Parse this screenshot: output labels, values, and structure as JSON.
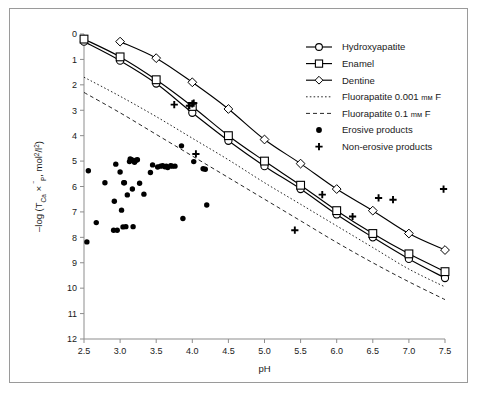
{
  "figure": {
    "border_color": "#9a9a9a",
    "background": "#ffffff",
    "line_color": "#000000"
  },
  "chart_data": {
    "type": "line",
    "title": "",
    "xlabel": "pH",
    "ylabel": "-log (T_Ca x T_P, mol2/l2)",
    "ylabel_parts": {
      "prefix": "–log (T",
      "sub1": "Ca",
      "mid": " × ",
      "overbar": "‾",
      "sub2": "P",
      "tail": ", mol",
      "sup1": "2",
      "slash": "/l",
      "sup2": "2",
      "close": ")"
    },
    "xlim": [
      2.5,
      7.5
    ],
    "ylim": [
      0,
      12
    ],
    "y_inverted": true,
    "grid": false,
    "xticks": [
      "2.5",
      "3.0",
      "3.5",
      "4.0",
      "4.5",
      "5.0",
      "5.5",
      "6.0",
      "6.5",
      "7.0",
      "7.5"
    ],
    "xtick_values": [
      2.5,
      3.0,
      3.5,
      4.0,
      4.5,
      5.0,
      5.5,
      6.0,
      6.5,
      7.0,
      7.5
    ],
    "yticks": [
      "0",
      "1",
      "2",
      "3",
      "4",
      "5",
      "6",
      "7",
      "8",
      "9",
      "10",
      "11",
      "12"
    ],
    "ytick_values": [
      0,
      1,
      2,
      3,
      4,
      5,
      6,
      7,
      8,
      9,
      10,
      11,
      12
    ],
    "legend_position": "top-right",
    "series": [
      {
        "name": "Hydroxyapatite",
        "marker": "circle",
        "linestyle": "solid",
        "x": [
          2.5,
          3.0,
          3.5,
          4.0,
          4.5,
          5.0,
          5.5,
          6.0,
          6.5,
          7.0,
          7.5
        ],
        "values": [
          0.3,
          1.05,
          1.95,
          3.1,
          4.2,
          5.2,
          6.1,
          7.1,
          8.0,
          8.85,
          9.6
        ]
      },
      {
        "name": "Enamel",
        "marker": "square",
        "linestyle": "solid",
        "x": [
          2.5,
          3.0,
          3.5,
          4.0,
          4.5,
          5.0,
          5.5,
          6.0,
          6.5,
          7.0,
          7.5
        ],
        "values": [
          0.2,
          0.9,
          1.8,
          2.85,
          4.0,
          5.0,
          5.95,
          6.95,
          7.85,
          8.65,
          9.35
        ]
      },
      {
        "name": "Dentine",
        "marker": "diamond",
        "linestyle": "solid",
        "x": [
          3.0,
          3.5,
          4.0,
          4.5,
          5.0,
          5.5,
          6.0,
          6.5,
          7.0,
          7.5
        ],
        "values": [
          0.3,
          0.95,
          1.9,
          2.95,
          4.15,
          5.1,
          6.1,
          6.95,
          7.85,
          8.5
        ]
      },
      {
        "name": "Fluorapatite 0.001 mM F",
        "label_prefix": "Fluorapatite 0.001 ",
        "label_unit": "mм",
        "label_suffix": " F",
        "marker": "none",
        "linestyle": "dotted",
        "x": [
          2.5,
          3.0,
          3.5,
          4.0,
          4.5,
          5.0,
          5.5,
          6.0,
          6.5,
          7.0,
          7.5
        ],
        "values": [
          1.7,
          2.45,
          3.25,
          4.1,
          4.95,
          5.85,
          6.7,
          7.55,
          8.4,
          9.25,
          9.95
        ]
      },
      {
        "name": "Fluorapatite 0.1 mM F",
        "label_prefix": "Fluorapatite 0.1 ",
        "label_unit": "mм",
        "label_suffix": " F",
        "marker": "none",
        "linestyle": "dashed",
        "x": [
          2.5,
          3.0,
          3.5,
          4.0,
          4.5,
          5.0,
          5.5,
          6.0,
          6.5,
          7.0,
          7.5
        ],
        "values": [
          2.3,
          3.1,
          3.95,
          4.8,
          5.65,
          6.5,
          7.35,
          8.2,
          9.0,
          9.75,
          10.45
        ]
      }
    ],
    "scatter": [
      {
        "name": "Erosive products",
        "marker": "filled-circle",
        "points": [
          [
            2.54,
            8.18
          ],
          [
            2.56,
            5.38
          ],
          [
            2.67,
            7.42
          ],
          [
            2.79,
            5.85
          ],
          [
            2.91,
            7.72
          ],
          [
            2.92,
            6.58
          ],
          [
            2.94,
            5.12
          ],
          [
            2.96,
            7.72
          ],
          [
            3.0,
            5.43
          ],
          [
            3.02,
            6.93
          ],
          [
            3.04,
            7.59
          ],
          [
            3.05,
            5.85
          ],
          [
            3.06,
            5.85
          ],
          [
            3.08,
            7.58
          ],
          [
            3.1,
            6.33
          ],
          [
            3.13,
            5.02
          ],
          [
            3.14,
            4.92
          ],
          [
            3.16,
            4.95
          ],
          [
            3.17,
            6.1
          ],
          [
            3.18,
            7.58
          ],
          [
            3.2,
            5.05
          ],
          [
            3.22,
            4.97
          ],
          [
            3.24,
            4.95
          ],
          [
            3.27,
            5.87
          ],
          [
            3.33,
            6.3
          ],
          [
            3.42,
            5.45
          ],
          [
            3.45,
            5.15
          ],
          [
            3.52,
            5.23
          ],
          [
            3.56,
            5.2
          ],
          [
            3.59,
            5.18
          ],
          [
            3.62,
            5.22
          ],
          [
            3.64,
            5.2
          ],
          [
            3.66,
            5.25
          ],
          [
            3.7,
            5.18
          ],
          [
            3.72,
            5.2
          ],
          [
            3.76,
            5.2
          ],
          [
            3.85,
            4.4
          ],
          [
            3.87,
            7.26
          ],
          [
            4.02,
            5.02
          ],
          [
            4.15,
            5.3
          ],
          [
            4.18,
            5.32
          ],
          [
            4.2,
            6.73
          ]
        ]
      },
      {
        "name": "Non-erosive products",
        "marker": "plus",
        "points": [
          [
            3.75,
            2.78
          ],
          [
            3.96,
            2.82
          ],
          [
            4.0,
            2.75
          ],
          [
            4.02,
            2.72
          ],
          [
            4.05,
            4.72
          ],
          [
            5.42,
            7.72
          ],
          [
            5.8,
            6.32
          ],
          [
            6.22,
            7.18
          ],
          [
            6.58,
            6.45
          ],
          [
            6.78,
            6.52
          ],
          [
            7.48,
            6.1
          ]
        ]
      }
    ],
    "legend_entries": [
      {
        "label": "Hydroxyapatite",
        "type": "line-marker",
        "marker": "circle",
        "linestyle": "solid"
      },
      {
        "label": "Enamel",
        "type": "line-marker",
        "marker": "square",
        "linestyle": "solid"
      },
      {
        "label": "Dentine",
        "type": "line-marker",
        "marker": "diamond",
        "linestyle": "solid"
      },
      {
        "label": "Fluorapatite 0.001 mM F",
        "type": "line",
        "marker": "none",
        "linestyle": "dotted"
      },
      {
        "label": "Fluorapatite 0.1 mM F",
        "type": "line",
        "marker": "none",
        "linestyle": "dashed"
      },
      {
        "label": "Erosive products",
        "type": "marker",
        "marker": "filled-circle",
        "linestyle": "none"
      },
      {
        "label": "Non-erosive products",
        "type": "marker",
        "marker": "plus",
        "linestyle": "none"
      }
    ]
  }
}
